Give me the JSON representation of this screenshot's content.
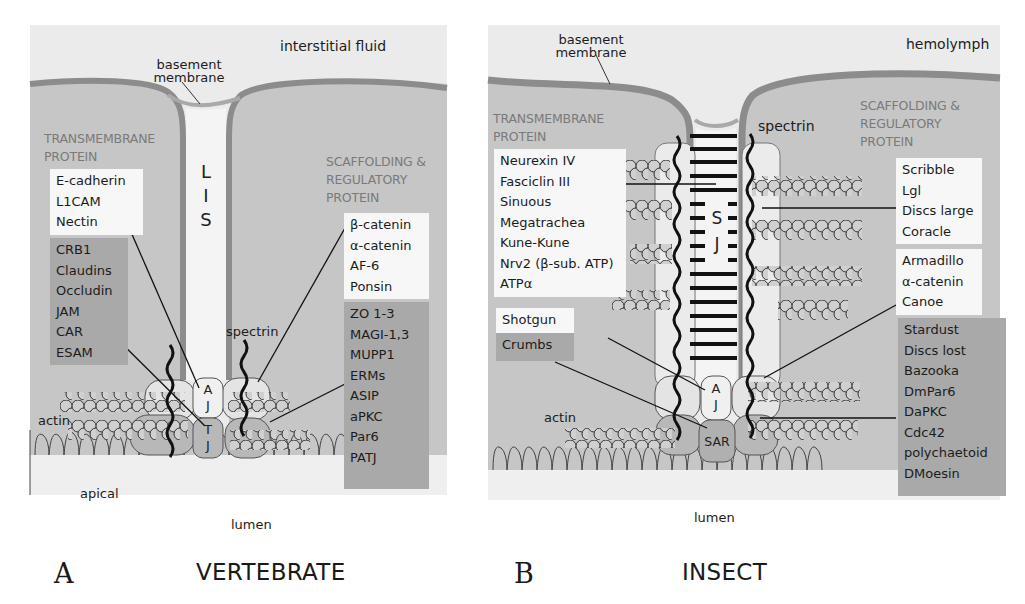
{
  "panel_a": {
    "letter": "A",
    "title": "VERTEBRATE",
    "region_label": "interstitial fluid",
    "basement_membrane": [
      "basement",
      "membrane"
    ],
    "lis_label": [
      "L",
      "I",
      "S"
    ],
    "transmembrane_header": [
      "TRANSMEMBRANE",
      "PROTEIN"
    ],
    "scaffolding_header": [
      "SCAFFOLDING &",
      "REGULATORY",
      "PROTEIN"
    ],
    "transmembrane_aj": [
      "E-cadherin",
      "L1CAM",
      "Nectin"
    ],
    "transmembrane_tj": [
      "CRB1",
      "Claudins",
      "Occludin",
      "JAM",
      "CAR",
      "ESAM"
    ],
    "scaffolding_aj": [
      "β-catenin",
      "α-catenin",
      "AF-6",
      "Ponsin"
    ],
    "scaffolding_tj": [
      "ZO 1-3",
      "MAGI-1,3",
      "MUPP1",
      "ERMs",
      "ASIP",
      "aPKC",
      "Par6",
      "PATJ"
    ],
    "spectrin": "spectrin",
    "actin": "actin",
    "apical": "apical",
    "lumen": "lumen",
    "aj_label": [
      "A",
      "J"
    ],
    "tj_label": [
      "T",
      "J"
    ]
  },
  "panel_b": {
    "letter": "B",
    "title": "INSECT",
    "region_label": "hemolymph",
    "basement_membrane": [
      "basement",
      "membrane"
    ],
    "transmembrane_header": [
      "TRANSMEMBRANE",
      "PROTEIN"
    ],
    "scaffolding_header": [
      "SCAFFOLDING &",
      "REGULATORY",
      "PROTEIN"
    ],
    "transmembrane_sj": [
      "Neurexin IV",
      "Fasciclin III",
      "Sinuous",
      "Megatrachea",
      "Kune-Kune",
      "Nrv2 (β-sub. ATP)",
      "ATPα"
    ],
    "transmembrane_aj": [
      "Shotgun"
    ],
    "transmembrane_sar": [
      "Crumbs"
    ],
    "scaffolding_sj": [
      "Scribble",
      "Lgl",
      "Discs large",
      "Coracle"
    ],
    "scaffolding_aj": [
      "Armadillo",
      "α-catenin",
      "Canoe"
    ],
    "scaffolding_sar": [
      "Stardust",
      "Discs lost",
      "Bazooka",
      "DmPar6",
      "DaPKC",
      "Cdc42",
      "polychaetoid",
      "DMoesin"
    ],
    "spectrin": "spectrin",
    "actin": "actin",
    "lumen": "lumen",
    "sj_label": [
      "S",
      "J"
    ],
    "aj_label": [
      "A",
      "J"
    ],
    "sar_label": "SAR"
  },
  "colors": {
    "background": "#ffffff",
    "fluid": "#e9e9e9",
    "cell": "#c6c6c6",
    "membrane": "#8c8c8c",
    "lumen_space": "#f2f2f2",
    "light_box": "#f7f7f7",
    "dark_box": "#a9a9a9",
    "header_text": "#7a7a7a"
  }
}
